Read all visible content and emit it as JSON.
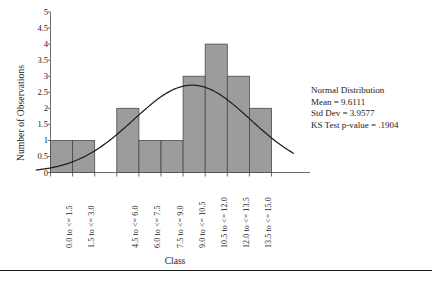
{
  "chart_data": {
    "type": "bar",
    "title": "",
    "xlabel": "Class",
    "ylabel": "Number of Observations",
    "categories": [
      "0.0 to <= 1.5",
      "1.5 to <= 3.0",
      "3.0 to <= 4.5",
      "4.5 to <= 6.0",
      "6.0 to <= 7.5",
      "7.5 to <= 9.0",
      "9.0 to <= 10.5",
      "10.5 to <= 12.0",
      "12.0 to <= 13.5",
      "13.5 to <= 15.0"
    ],
    "values": [
      1,
      1,
      0,
      2,
      1,
      1,
      3,
      4,
      3,
      2
    ],
    "visible_xtick_labels": [
      "0.0 to <= 1.5",
      "1.5 to <= 3.0",
      "4.5 to <= 6.0",
      "6.0 to <= 7.5",
      "7.5 to <= 9.0",
      "9.0 to <= 10.5",
      "10.5 to <= 12.0",
      "12.0 to <= 13.5",
      "13.5 to <= 15.0"
    ],
    "ylim": [
      0,
      5
    ],
    "yticks": [
      "0",
      "0.5",
      "1",
      "1.5",
      "2",
      "2.5",
      "3",
      "3.5",
      "4",
      "4.5",
      "5"
    ],
    "ytick_values": [
      0,
      0.5,
      1,
      1.5,
      2,
      2.5,
      3,
      3.5,
      4,
      4.5,
      5
    ],
    "grid": false,
    "legend": "none",
    "bar_color": "#9c9c9c",
    "bar_edge_color": "#4a4a4a",
    "curve_color": "#1f1f1f",
    "axis_color": "#6e6e6e",
    "overlay_curve": {
      "name": "Normal Distribution",
      "mean": 9.6111,
      "std_dev": 3.9577,
      "peak_value": 2.72
    }
  },
  "annotation": {
    "line1": "Normal Distribution",
    "line2": "Mean = 9.6111",
    "line3": "Std Dev = 3.9577",
    "line4": "KS Test p-value = .1904"
  }
}
